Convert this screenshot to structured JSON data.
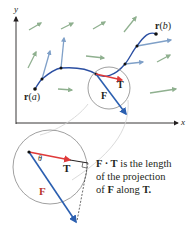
{
  "axes": {
    "x_label": "x",
    "y_label": "y"
  },
  "curve": {
    "start_label_prefix": "r",
    "start_label_param": "a",
    "end_label_prefix": "r",
    "end_label_param": "b"
  },
  "vectors": {
    "F_label": "F",
    "T_label": "T",
    "theta_label": "θ"
  },
  "caption": {
    "part1_bold": "F · T",
    "part2": " is the length",
    "line2": "of the projection",
    "line3_pre": "of ",
    "line3_bold1": "F",
    "line3_mid": " along ",
    "line3_bold2": "T."
  },
  "colors": {
    "curve": "#2b4fa2",
    "field_vectors_gray": "#8fa58f",
    "field_vectors_blue": "#6f9bd1",
    "F_vector": "#2b5fb0",
    "T_vector": "#e03a3a",
    "axis": "#231f20",
    "circle": "#888888"
  }
}
